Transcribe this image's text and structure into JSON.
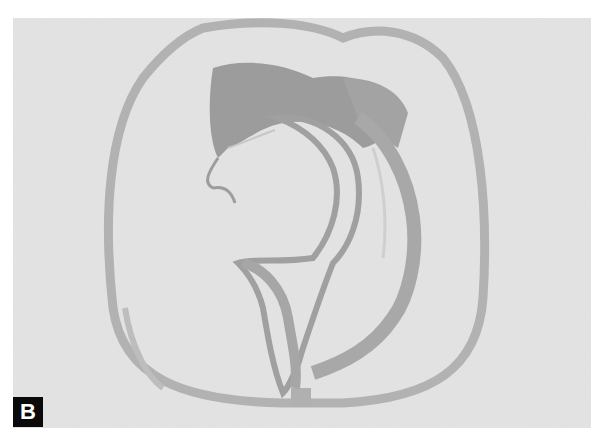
{
  "figure": {
    "panel_label": "B",
    "colors": {
      "background": "#e6e6e6",
      "capsule": "#b4b4b4",
      "dark_tissue": "#9a9a9a",
      "label_bg": "#0a0a0a",
      "label_fg": "#ffffff"
    }
  }
}
